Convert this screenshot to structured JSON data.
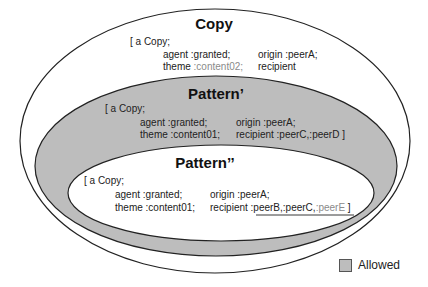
{
  "colors": {
    "allowed_fill": "#bdbdbd",
    "stroke": "#222222",
    "muted_text": "#8a8a8a"
  },
  "copy": {
    "title": "Copy",
    "open": "[ a Copy;",
    "agent": "agent :granted;",
    "origin": "origin :peerA;",
    "theme_label": "theme ",
    "theme_value": ":content02;",
    "recipient": "recipient"
  },
  "pattern1": {
    "title": "Pattern’",
    "open": "[ a Copy;",
    "agent": "agent :granted;",
    "origin": "origin :peerA;",
    "theme": "theme :content01;",
    "recipient": "recipient :peerC,:peerD ]"
  },
  "pattern2": {
    "title": "Pattern’’",
    "open": "[ a Copy;",
    "agent": "agent :granted;",
    "origin": "origin :peerA;",
    "theme": "theme :content01;",
    "recipient_label": "recipient ",
    "recipient_values": ":peerB,:peerC,",
    "recipient_muted": ":peerE",
    "close": " ]"
  },
  "legend": {
    "label": "Allowed"
  }
}
